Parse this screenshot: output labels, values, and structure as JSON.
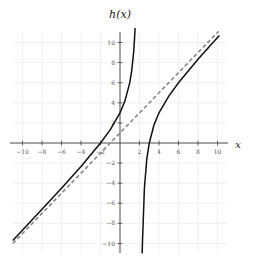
{
  "chart_data": {
    "type": "line",
    "title": "h(x)",
    "xlabel": "x",
    "ylabel": "",
    "xlim": [
      -11,
      11
    ],
    "ylim": [
      -11,
      11
    ],
    "grid": true,
    "x_ticks": [
      -10,
      -8,
      -6,
      -4,
      -2,
      2,
      4,
      6,
      8,
      10
    ],
    "y_ticks": [
      -10,
      -8,
      -6,
      -4,
      -2,
      2,
      4,
      6,
      8,
      10
    ],
    "x_tick_labels": [
      "−10",
      "−8",
      "−6",
      "−4",
      "−2",
      "2",
      "4",
      "6",
      "8",
      "10"
    ],
    "y_tick_labels": [
      "−10",
      "−8",
      "−6",
      "−4",
      "−2",
      "2",
      "4",
      "6",
      "8",
      "10"
    ],
    "series": [
      {
        "name": "h(x) left branch",
        "style": "solid",
        "color": "#111111",
        "x": [
          -11,
          -8,
          -6,
          -4,
          -2,
          -1,
          0,
          0.5,
          1,
          1.2,
          1.4,
          1.5,
          1.55
        ],
        "y": [
          -9.69,
          -6.6,
          -4.5,
          -2.33,
          0,
          1.33,
          3,
          4.17,
          6,
          7.2,
          9.07,
          10.5,
          11.44
        ]
      },
      {
        "name": "h(x) right branch",
        "style": "solid",
        "color": "#111111",
        "x": [
          2.28,
          2.3,
          2.5,
          2.75,
          3,
          3.5,
          4,
          5,
          6,
          8,
          10,
          10.2
        ],
        "y": [
          -11.0,
          -10.03,
          -4.5,
          -1.58,
          0,
          1.83,
          3,
          4.67,
          6,
          8.33,
          10.5,
          10.71
        ]
      },
      {
        "name": "oblique asymptote y = x + 1",
        "style": "dashed",
        "color": "#888888",
        "x": [
          -11,
          10.1
        ],
        "y": [
          -10,
          11.1
        ]
      }
    ],
    "annotations": {
      "vertical_asymptote": "x = 2 (implied, not drawn)",
      "x_intercepts": [
        -2,
        3
      ],
      "y_intercept": 3
    }
  },
  "labels": {
    "title": "h(x)",
    "x_axis": "x"
  }
}
